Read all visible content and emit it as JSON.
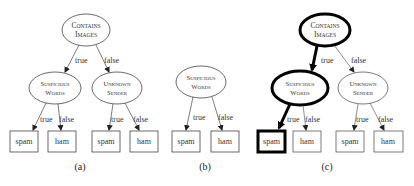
{
  "diagram": {
    "type": "decision-tree-comparison",
    "colors": {
      "stroke": "#444444",
      "text": "#333333",
      "background": "#ffffff",
      "highlight": "#000000"
    },
    "panels": [
      {
        "label": "(a)",
        "root": {
          "line1": "Contains",
          "line2": "Images"
        },
        "edges": [
          {
            "label": "true"
          },
          {
            "label": "false"
          },
          {
            "label": "true"
          },
          {
            "label": "false"
          },
          {
            "label": "true"
          },
          {
            "label": "false"
          }
        ],
        "internal": [
          {
            "line1": "Suspicious",
            "line2": "Words"
          },
          {
            "line1": "Unknown",
            "line2": "Sender"
          }
        ],
        "leaves": [
          "spam",
          "ham",
          "spam",
          "ham"
        ]
      },
      {
        "label": "(b)",
        "root": {
          "line1": "Suspicious",
          "line2": "Words"
        },
        "edges": [
          {
            "label": "true"
          },
          {
            "label": "false"
          }
        ],
        "leaves": [
          "spam",
          "ham"
        ]
      },
      {
        "label": "(c)",
        "root": {
          "line1": "Contains",
          "line2": "Images"
        },
        "edges": [
          {
            "label": "true",
            "highlighted": true
          },
          {
            "label": "false"
          },
          {
            "label": "true",
            "highlighted": true
          },
          {
            "label": "false"
          },
          {
            "label": "true"
          },
          {
            "label": "false"
          }
        ],
        "internal": [
          {
            "line1": "Suspicious",
            "line2": "Words",
            "highlighted": true
          },
          {
            "line1": "Unknown",
            "line2": "Sender"
          }
        ],
        "leaves": [
          "spam",
          "ham",
          "spam",
          "ham"
        ],
        "highlighted_path": [
          "Contains Images",
          "Suspicious Words",
          "spam"
        ]
      }
    ]
  }
}
